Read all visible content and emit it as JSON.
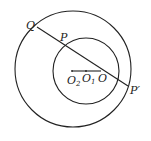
{
  "diagram": {
    "type": "geometry",
    "stroke_color": "#222222",
    "background": "#ffffff",
    "large_circle": {
      "cx": 73,
      "cy": 69,
      "r": 58
    },
    "small_circle": {
      "cx": 86,
      "cy": 71,
      "r": 33
    },
    "secant": {
      "x1": 37,
      "y1": 27,
      "x2": 128,
      "y2": 86
    },
    "center_segment": {
      "x1": 72,
      "y1": 71,
      "x2": 101,
      "y2": 71
    },
    "labels": {
      "Q": "Q",
      "P": "P",
      "P_prime": "P′",
      "O2_main": "O",
      "O2_sub": "2",
      "O1_main": "O",
      "O1_sub": "1",
      "O": "O"
    }
  }
}
